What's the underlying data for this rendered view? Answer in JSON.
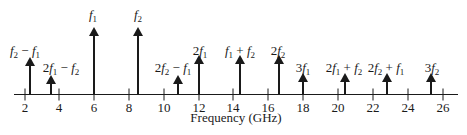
{
  "figure": {
    "xlabel": "Frequency (GHz)",
    "axis": {
      "min": 1.3,
      "max": 27,
      "ticks": [
        2,
        4,
        6,
        8,
        10,
        12,
        14,
        16,
        18,
        20,
        22,
        24,
        26
      ]
    },
    "color": "#1a1a1a"
  },
  "chart_data": {
    "type": "bar",
    "title": "",
    "xlabel": "Frequency (GHz)",
    "ylabel": "",
    "xlim": [
      1.3,
      27
    ],
    "x_ticks": [
      2,
      4,
      6,
      8,
      10,
      12,
      14,
      16,
      18,
      20,
      22,
      24,
      26
    ],
    "grid": false,
    "series": [
      {
        "name": "f2 - f1",
        "x": 2.3,
        "relative_amplitude": 0.55
      },
      {
        "name": "2f1 - f2",
        "x": 3.5,
        "relative_amplitude": 0.3
      },
      {
        "name": "f1",
        "x": 6.0,
        "relative_amplitude": 1.0
      },
      {
        "name": "f2",
        "x": 8.5,
        "relative_amplitude": 1.0
      },
      {
        "name": "2f2 - f1",
        "x": 10.9,
        "relative_amplitude": 0.3
      },
      {
        "name": "2f1",
        "x": 12.0,
        "relative_amplitude": 0.6
      },
      {
        "name": "f1 + f2",
        "x": 14.4,
        "relative_amplitude": 0.6
      },
      {
        "name": "2f2",
        "x": 16.6,
        "relative_amplitude": 0.6
      },
      {
        "name": "3f1",
        "x": 18.0,
        "relative_amplitude": 0.32
      },
      {
        "name": "2f1 + f2",
        "x": 20.4,
        "relative_amplitude": 0.32
      },
      {
        "name": "2f2 + f1",
        "x": 22.8,
        "relative_amplitude": 0.32
      },
      {
        "name": "3f2",
        "x": 25.3,
        "relative_amplitude": 0.32
      }
    ]
  },
  "spectral_lines": [
    {
      "id": "f2-minus-f1",
      "x": 30,
      "tip": 57,
      "label_x": 25,
      "label_y": 44,
      "parts": [
        [
          "i",
          "f"
        ],
        [
          "sub",
          "2"
        ],
        [
          "t",
          " − "
        ],
        [
          "i",
          "f"
        ],
        [
          "sub",
          "1"
        ]
      ]
    },
    {
      "id": "2f1-minus-f2",
      "x": 51,
      "tip": 75,
      "label_x": 61,
      "label_y": 61,
      "parts": [
        [
          "t",
          "2"
        ],
        [
          "i",
          "f"
        ],
        [
          "sub",
          "1"
        ],
        [
          "t",
          " − "
        ],
        [
          "i",
          "f"
        ],
        [
          "sub",
          "2"
        ]
      ]
    },
    {
      "id": "f1",
      "x": 94,
      "tip": 27,
      "label_x": 93,
      "label_y": 8,
      "parts": [
        [
          "i",
          "f"
        ],
        [
          "sub",
          "1"
        ]
      ]
    },
    {
      "id": "f2",
      "x": 138,
      "tip": 27,
      "label_x": 138,
      "label_y": 8,
      "parts": [
        [
          "i",
          "f"
        ],
        [
          "sub",
          "2"
        ]
      ]
    },
    {
      "id": "2f2-minus-f1",
      "x": 178,
      "tip": 75,
      "label_x": 173,
      "label_y": 61,
      "parts": [
        [
          "t",
          "2"
        ],
        [
          "i",
          "f"
        ],
        [
          "sub",
          "2"
        ],
        [
          "t",
          " − "
        ],
        [
          "i",
          "f"
        ],
        [
          "sub",
          "1"
        ]
      ]
    },
    {
      "id": "2f1",
      "x": 199,
      "tip": 55,
      "label_x": 200,
      "label_y": 44,
      "parts": [
        [
          "t",
          "2"
        ],
        [
          "i",
          "f"
        ],
        [
          "sub",
          "1"
        ]
      ]
    },
    {
      "id": "f1-plus-f2",
      "x": 240,
      "tip": 55,
      "label_x": 240,
      "label_y": 44,
      "parts": [
        [
          "i",
          "f"
        ],
        [
          "sub",
          "1"
        ],
        [
          "t",
          " + "
        ],
        [
          "i",
          "f"
        ],
        [
          "sub",
          "2"
        ]
      ]
    },
    {
      "id": "2f2",
      "x": 279,
      "tip": 55,
      "label_x": 278,
      "label_y": 44,
      "parts": [
        [
          "t",
          "2"
        ],
        [
          "i",
          "f"
        ],
        [
          "sub",
          "2"
        ]
      ]
    },
    {
      "id": "3f1",
      "x": 303,
      "tip": 73,
      "label_x": 303,
      "label_y": 61,
      "parts": [
        [
          "t",
          "3"
        ],
        [
          "i",
          "f"
        ],
        [
          "sub",
          "1"
        ]
      ]
    },
    {
      "id": "2f1-plus-f2",
      "x": 345,
      "tip": 73,
      "label_x": 344,
      "label_y": 61,
      "parts": [
        [
          "t",
          "2"
        ],
        [
          "i",
          "f"
        ],
        [
          "sub",
          "1"
        ],
        [
          "t",
          " + "
        ],
        [
          "i",
          "f"
        ],
        [
          "sub",
          "2"
        ]
      ]
    },
    {
      "id": "2f2-plus-f1",
      "x": 387,
      "tip": 73,
      "label_x": 386,
      "label_y": 61,
      "parts": [
        [
          "t",
          "2"
        ],
        [
          "i",
          "f"
        ],
        [
          "sub",
          "2"
        ],
        [
          "t",
          " + "
        ],
        [
          "i",
          "f"
        ],
        [
          "sub",
          "1"
        ]
      ]
    },
    {
      "id": "3f2",
      "x": 431,
      "tip": 73,
      "label_x": 432,
      "label_y": 61,
      "parts": [
        [
          "t",
          "3"
        ],
        [
          "i",
          "f"
        ],
        [
          "sub",
          "2"
        ]
      ]
    }
  ],
  "tick_positions": [
    {
      "label": "2",
      "x": 25
    },
    {
      "label": "4",
      "x": 59
    },
    {
      "label": "6",
      "x": 94
    },
    {
      "label": "8",
      "x": 129
    },
    {
      "label": "10",
      "x": 164
    },
    {
      "label": "12",
      "x": 199
    },
    {
      "label": "14",
      "x": 233
    },
    {
      "label": "16",
      "x": 268
    },
    {
      "label": "18",
      "x": 303
    },
    {
      "label": "20",
      "x": 338
    },
    {
      "label": "22",
      "x": 373
    },
    {
      "label": "24",
      "x": 408
    },
    {
      "label": "26",
      "x": 443
    }
  ]
}
